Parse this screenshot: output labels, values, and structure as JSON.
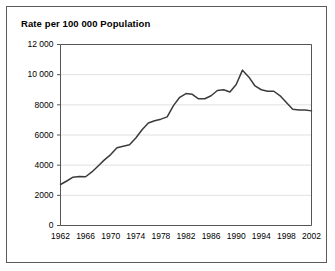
{
  "figure": {
    "title": "Rate per 100 000 Population",
    "border_color": "#5a5a5a",
    "background_color": "#ffffff"
  },
  "chart_data": {
    "type": "line",
    "title": "Rate per 100 000 Population",
    "xlabel": "",
    "ylabel": "Rate per 100 000 Population",
    "xlim": [
      1962,
      2002
    ],
    "ylim": [
      0,
      12000
    ],
    "grid": true,
    "legend": null,
    "line_color": "#3b3b3b",
    "ytick_labels": [
      "12 000",
      "10 000",
      "8000",
      "6000",
      "4000",
      "2000",
      "0"
    ],
    "ytick_values": [
      12000,
      10000,
      8000,
      6000,
      4000,
      2000,
      0
    ],
    "xtick_labels": [
      "1962",
      "1966",
      "1970",
      "1974",
      "1978",
      "1982",
      "1986",
      "1990",
      "1994",
      "1998",
      "2002"
    ],
    "xtick_values": [
      1962,
      1966,
      1970,
      1974,
      1978,
      1982,
      1986,
      1990,
      1994,
      1998,
      2002
    ],
    "x": [
      1962,
      1963,
      1964,
      1965,
      1966,
      1967,
      1968,
      1969,
      1970,
      1971,
      1972,
      1973,
      1974,
      1975,
      1976,
      1977,
      1978,
      1979,
      1980,
      1981,
      1982,
      1983,
      1984,
      1985,
      1986,
      1987,
      1988,
      1989,
      1990,
      1991,
      1992,
      1993,
      1994,
      1995,
      1996,
      1997,
      1998,
      1999,
      2000,
      2001,
      2002
    ],
    "values": [
      2720,
      2950,
      3200,
      3250,
      3230,
      3550,
      3950,
      4350,
      4700,
      5150,
      5250,
      5350,
      5800,
      6350,
      6800,
      6950,
      7050,
      7200,
      7950,
      8500,
      8750,
      8700,
      8400,
      8400,
      8600,
      8950,
      9000,
      8850,
      9350,
      10300,
      9850,
      9250,
      9000,
      8900,
      8900,
      8600,
      8150,
      7700,
      7650,
      7650,
      7600
    ]
  }
}
